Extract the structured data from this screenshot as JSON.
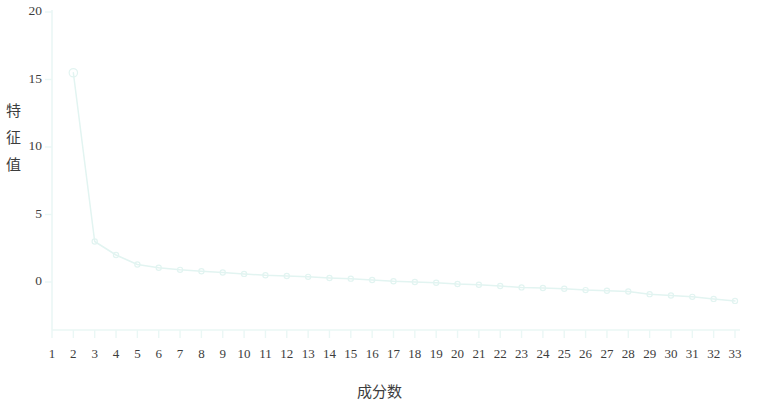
{
  "chart_data": {
    "type": "line",
    "title": "",
    "xlabel": "成分数",
    "ylabel": "特征值",
    "xlim": [
      1,
      33
    ],
    "ylim": [
      -3.5,
      20
    ],
    "grid": false,
    "legend": null,
    "y_ticks": [
      0,
      5,
      10,
      15,
      20
    ],
    "y_tick_labels": [
      "0",
      "5",
      "10",
      "15",
      "20"
    ],
    "x_ticks": [
      1,
      2,
      3,
      4,
      5,
      6,
      7,
      8,
      9,
      10,
      11,
      12,
      13,
      14,
      15,
      16,
      17,
      18,
      19,
      20,
      21,
      22,
      23,
      24,
      25,
      26,
      27,
      28,
      29,
      30,
      31,
      32,
      33
    ],
    "x_tick_labels": [
      "1",
      "2",
      "3",
      "4",
      "5",
      "6",
      "7",
      "8",
      "9",
      "10",
      "11",
      "12",
      "13",
      "14",
      "15",
      "16",
      "17",
      "18",
      "19",
      "20",
      "21",
      "22",
      "23",
      "24",
      "25",
      "26",
      "27",
      "28",
      "29",
      "30",
      "31",
      "32",
      "33"
    ],
    "series": [
      {
        "name": "特征值",
        "marker": "circle",
        "color": "#e2f4f1",
        "x": [
          2,
          3,
          4,
          5,
          6,
          7,
          8,
          9,
          10,
          11,
          12,
          13,
          14,
          15,
          16,
          17,
          18,
          19,
          20,
          21,
          22,
          23,
          24,
          25,
          26,
          27,
          28,
          29,
          30,
          31,
          32,
          33
        ],
        "values": [
          15.5,
          3.0,
          2.0,
          1.3,
          1.05,
          0.9,
          0.8,
          0.7,
          0.6,
          0.5,
          0.45,
          0.38,
          0.3,
          0.25,
          0.15,
          0.05,
          0.0,
          -0.05,
          -0.15,
          -0.2,
          -0.3,
          -0.4,
          -0.45,
          -0.5,
          -0.6,
          -0.65,
          -0.7,
          -0.9,
          -1.0,
          -1.1,
          -1.25,
          -1.4
        ]
      }
    ]
  },
  "axes": {
    "y_axis_title": "特征值",
    "x_axis_title": "成分数"
  },
  "style": {
    "line_color": "#e2f4f1",
    "axis_color": "#eaf7f5",
    "text_color": "#3d3d3d",
    "background": "#ffffff"
  }
}
